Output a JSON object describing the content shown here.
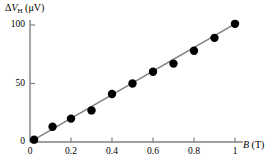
{
  "chart_data": {
    "type": "scatter",
    "title": "",
    "subtitle": "",
    "xlabel": "B (T)",
    "xlabel_symbol": "B",
    "xlabel_unit": "(T)",
    "ylabel": "ΔV_H (μV)",
    "ylabel_delta": "Δ",
    "ylabel_symbol": "V",
    "ylabel_subscript": "H",
    "ylabel_unit": "(μV)",
    "xlim": [
      0,
      1.05
    ],
    "ylim": [
      0,
      107
    ],
    "xticks": [
      0,
      0.2,
      0.4,
      0.6,
      0.8,
      1
    ],
    "xticklabels": [
      "0",
      "0.2",
      "0.4",
      "0.6",
      "0.8",
      "1"
    ],
    "yticks": [
      0,
      50,
      100
    ],
    "yticklabels": [
      "0",
      "50",
      "100"
    ],
    "grid": false,
    "legend": false,
    "legend_position": "none",
    "x": [
      0.02,
      0.11,
      0.2,
      0.3,
      0.4,
      0.5,
      0.6,
      0.7,
      0.8,
      0.9,
      1.0
    ],
    "values": [
      2,
      13,
      20,
      27,
      41,
      50,
      60,
      67,
      78,
      89,
      101
    ],
    "series": [
      {
        "name": "Hall voltage measurements",
        "marker": "filled-circle",
        "marker_color": "#000000",
        "marker_size": 4.2,
        "x": [
          0.02,
          0.11,
          0.2,
          0.3,
          0.4,
          0.5,
          0.6,
          0.7,
          0.8,
          0.9,
          1.0
        ],
        "values": [
          2,
          13,
          20,
          27,
          41,
          50,
          60,
          67,
          78,
          89,
          101
        ]
      },
      {
        "name": "Best-fit line",
        "type": "line",
        "line_color": "#808080",
        "line_width": 1.6,
        "x": [
          0.02,
          1.0
        ],
        "values": [
          2,
          101
        ]
      }
    ],
    "axis_color": "#808080",
    "text_color": "#000000"
  },
  "axes": {
    "x_axis_name": "magnetic-field-axis",
    "y_axis_name": "hall-voltage-axis"
  }
}
